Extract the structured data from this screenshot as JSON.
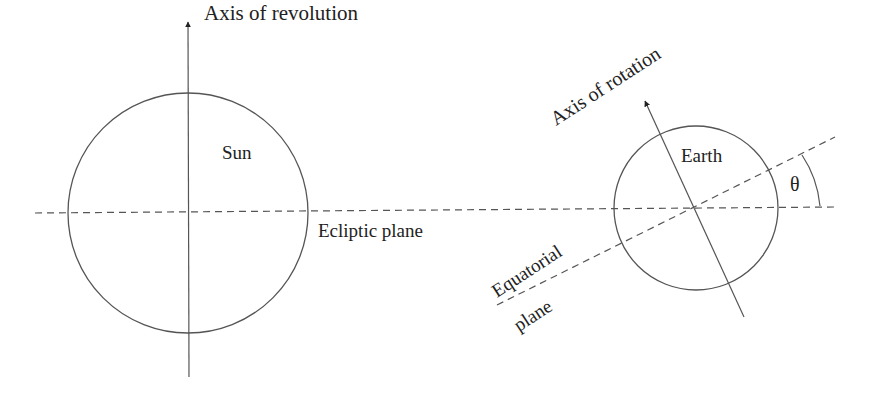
{
  "diagram": {
    "colors": {
      "line": "#555555",
      "text": "#222222",
      "background": "#ffffff"
    },
    "labels": {
      "axis_of_revolution": "Axis of revolution",
      "sun": "Sun",
      "ecliptic_plane": "Ecliptic plane",
      "axis_of_rotation": "Axis of rotation",
      "earth": "Earth",
      "theta": "θ",
      "equatorial": "Equatorial",
      "plane": "plane"
    },
    "bodies": [
      {
        "name": "Sun",
        "cx": 188,
        "cy": 213,
        "r": 120
      },
      {
        "name": "Earth",
        "cx": 696,
        "cy": 208,
        "r": 82
      }
    ]
  }
}
